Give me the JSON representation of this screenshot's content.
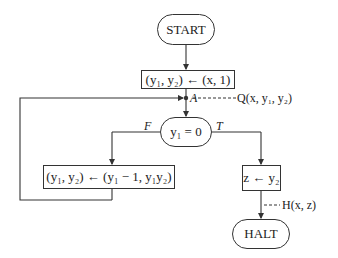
{
  "diagram": {
    "type": "flowchart",
    "nodes": {
      "start": "START",
      "init": "(y₁, y₂) ← (x, 1)",
      "test": "y₁ = 0",
      "loop_body": "(y₁, y₂) ← (y₁ − 1, y₁y₂)",
      "assign_z": "z ← y₂",
      "halt": "HALT"
    },
    "labels": {
      "point_a": "A",
      "invariant": "Q(x, y₁, y₂)",
      "false_branch": "F",
      "true_branch": "T",
      "output_assertion": "H(x, z)"
    }
  }
}
